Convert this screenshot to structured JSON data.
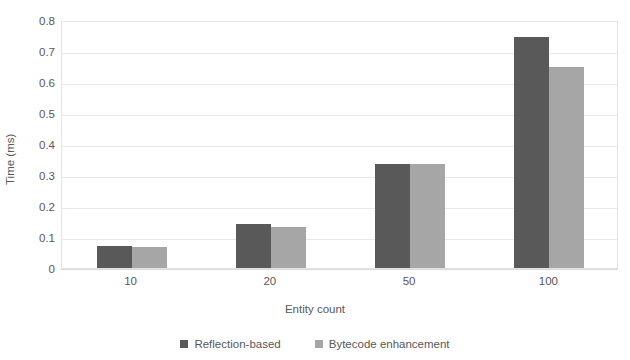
{
  "chart_data": {
    "type": "bar",
    "title": "",
    "xlabel": "Entity count",
    "ylabel": "Time (ms)",
    "categories": [
      "10",
      "20",
      "50",
      "100"
    ],
    "series": [
      {
        "name": "Reflection-based",
        "color": "#595959",
        "values": [
          0.072,
          0.142,
          0.337,
          0.745
        ]
      },
      {
        "name": "Bytecode enhancement",
        "color": "#a6a6a6",
        "values": [
          0.068,
          0.131,
          0.337,
          0.65
        ]
      }
    ],
    "ylim": [
      0,
      0.8
    ],
    "ytick_labels": [
      "0",
      "0.1",
      "0.2",
      "0.3",
      "0.4",
      "0.5",
      "0.6",
      "0.7",
      "0.8"
    ],
    "ytick_values": [
      0,
      0.1,
      0.2,
      0.3,
      0.4,
      0.5,
      0.6,
      0.7,
      0.8
    ],
    "grid": true,
    "legend_position": "bottom",
    "plot_background": "#ffffff",
    "grid_color": "#e8e8e8"
  }
}
